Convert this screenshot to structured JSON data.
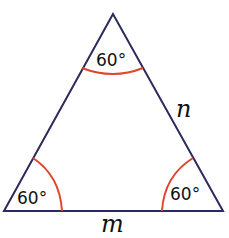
{
  "diagram": {
    "type": "equilateral-triangle",
    "line_color": "#2b2a5e",
    "arc_color": "#e0452e",
    "angles": {
      "top": "60°",
      "bottom_left": "60°",
      "bottom_right": "60°"
    },
    "sides": {
      "right": "n",
      "bottom": "m"
    }
  }
}
